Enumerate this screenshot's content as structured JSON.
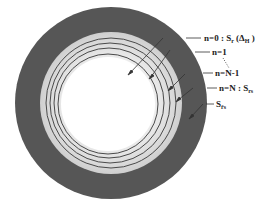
{
  "diagram": {
    "type": "concentric-ring cross-section",
    "colors": {
      "outer_band": "#565656",
      "inner_band": "#d6d6d6",
      "ring_line": "#4a4a4a",
      "core": "#ffffff",
      "text": "#222222"
    },
    "labels": [
      {
        "id": "n0",
        "main": "n=0 : S",
        "sub": "r",
        "suffix_main": " (Δ",
        "suffix_sub": "H",
        "suffix_end": " )"
      },
      {
        "id": "n1",
        "main": "n=1",
        "sub": "",
        "suffix_main": "",
        "suffix_sub": "",
        "suffix_end": ""
      },
      {
        "id": "nN1",
        "main": "n=N-1",
        "sub": "",
        "suffix_main": "",
        "suffix_sub": "",
        "suffix_end": ""
      },
      {
        "id": "nN",
        "main": "n=N : S",
        "sub": "rs",
        "suffix_main": "",
        "suffix_sub": "",
        "suffix_end": ""
      },
      {
        "id": "Srs",
        "main": "S",
        "sub": "r̄s",
        "suffix_main": "",
        "suffix_sub": "",
        "suffix_end": ""
      }
    ]
  }
}
